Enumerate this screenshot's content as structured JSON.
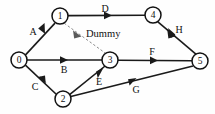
{
  "diagram": {
    "type": "activity-on-arrow-network",
    "title": "",
    "background_color": "#fefefe",
    "line_color": "#1a1a1a",
    "dummy_color": "#7d7d7d",
    "nodes": [
      {
        "id": "0",
        "label": "0",
        "cx": 19,
        "cy": 60,
        "r": 8
      },
      {
        "id": "1",
        "label": "1",
        "cx": 60,
        "cy": 16,
        "r": 8
      },
      {
        "id": "2",
        "label": "2",
        "cx": 63,
        "cy": 99,
        "r": 8
      },
      {
        "id": "3",
        "label": "3",
        "cx": 110,
        "cy": 60,
        "r": 8
      },
      {
        "id": "4",
        "label": "4",
        "cx": 153,
        "cy": 15,
        "r": 8
      },
      {
        "id": "5",
        "label": "5",
        "cx": 200,
        "cy": 61,
        "r": 8
      }
    ],
    "edges": [
      {
        "id": "A",
        "label": "A",
        "from": "0",
        "to": "1",
        "style": "solid",
        "label_x": 33,
        "label_y": 31
      },
      {
        "id": "B",
        "label": "B",
        "from": "0",
        "to": "3",
        "style": "solid",
        "label_x": 64,
        "label_y": 69
      },
      {
        "id": "C",
        "label": "C",
        "from": "0",
        "to": "2",
        "style": "solid",
        "label_x": 35,
        "label_y": 86
      },
      {
        "id": "D",
        "label": "D",
        "from": "1",
        "to": "4",
        "style": "solid",
        "label_x": 105,
        "label_y": 8
      },
      {
        "id": "E",
        "label": "E",
        "from": "2",
        "to": "3",
        "style": "solid",
        "label_x": 99,
        "label_y": 81
      },
      {
        "id": "F",
        "label": "F",
        "from": "3",
        "to": "5",
        "style": "solid",
        "label_x": 152,
        "label_y": 51
      },
      {
        "id": "G",
        "label": "G",
        "from": "2",
        "to": "5",
        "style": "solid",
        "label_x": 136,
        "label_y": 89
      },
      {
        "id": "H",
        "label": "H",
        "from": "4",
        "to": "5",
        "style": "solid",
        "label_x": 179,
        "label_y": 29
      },
      {
        "id": "Dummy",
        "label": "Dummy",
        "from": "1",
        "to": "3",
        "style": "dashed",
        "label_x": 86,
        "label_y": 33
      }
    ]
  }
}
